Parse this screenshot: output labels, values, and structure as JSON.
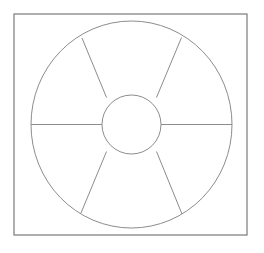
{
  "document": {
    "title": "Sectored Annulus Diagram",
    "description": "Line drawing of a circle divided into six sectors around a central hub, enclosed in a square frame",
    "background_color": "#ffffff"
  },
  "canvas": {
    "width": 264,
    "height": 253
  },
  "frame": {
    "name": "square-frame",
    "x": 14,
    "y": 14,
    "width": 233,
    "height": 221,
    "stroke_color": "#7a7a7a",
    "stroke_width": 1.2,
    "fill": "none"
  },
  "figure": {
    "center_x": 131.5,
    "center_y": 124.5,
    "outer_circle": {
      "name": "outer-circle",
      "rx": 100.5,
      "ry": 103.5,
      "stroke_color": "#8c8c8c",
      "stroke_width": 1.0,
      "fill": "none"
    },
    "inner_circle": {
      "name": "inner-circle",
      "rx": 29.5,
      "ry": 29.5,
      "stroke_color": "#8c8c8c",
      "stroke_width": 1.0,
      "fill": "none"
    },
    "spokes": [
      {
        "name": "spoke-left",
        "angle_degrees": 180,
        "x1": 102.0,
        "y1": 124.5,
        "x2": 31.0,
        "y2": 124.5
      },
      {
        "name": "spoke-right",
        "angle_degrees": 0,
        "x1": 161.0,
        "y1": 124.5,
        "x2": 232.0,
        "y2": 124.5
      },
      {
        "name": "spoke-upper-left",
        "angle_degrees": 248,
        "x1": 106.5,
        "y1": 97.5,
        "x2": 82.0,
        "y2": 38.0
      },
      {
        "name": "spoke-upper-right",
        "angle_degrees": 292,
        "x1": 156.5,
        "y1": 97.5,
        "x2": 181.5,
        "y2": 37.5
      },
      {
        "name": "spoke-lower-left",
        "angle_degrees": 112,
        "x1": 106.5,
        "y1": 151.5,
        "x2": 81.0,
        "y2": 213.0
      },
      {
        "name": "spoke-lower-right",
        "angle_degrees": 68,
        "x1": 156.5,
        "y1": 151.5,
        "x2": 182.0,
        "y2": 214.0
      }
    ],
    "sectors": [
      {
        "name": "sector-top",
        "index": 1
      },
      {
        "name": "sector-upper-right",
        "index": 2
      },
      {
        "name": "sector-lower-right",
        "index": 3
      },
      {
        "name": "sector-bottom",
        "index": 4
      },
      {
        "name": "sector-lower-left",
        "index": 5
      },
      {
        "name": "sector-upper-left",
        "index": 6
      }
    ],
    "sector_count": 6
  },
  "chart_data": {
    "type": "pie",
    "title": "",
    "subtitle": "",
    "xlabel": "",
    "ylabel": "",
    "grid": false,
    "legend_position": "none",
    "shape": "donut",
    "inner_radius_ratio": 0.29,
    "categories": [
      "sector-top",
      "sector-upper-right",
      "sector-lower-right",
      "sector-bottom",
      "sector-lower-left",
      "sector-upper-left"
    ],
    "values": [
      60,
      60,
      60,
      60,
      60,
      60
    ],
    "units": "degrees",
    "annotations": []
  }
}
